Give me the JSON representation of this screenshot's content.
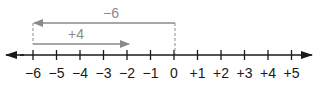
{
  "diagram": {
    "colors": {
      "axis": "#1a1a1a",
      "arrow": "#8a8a8a",
      "label": "#1a1a1a",
      "arrow_label": "#8a8a8a"
    },
    "number_line": {
      "min": -6,
      "max": 5,
      "ticks": [
        {
          "value": -6,
          "label": "−6"
        },
        {
          "value": -5,
          "label": "−5"
        },
        {
          "value": -4,
          "label": "−4"
        },
        {
          "value": -3,
          "label": "−3"
        },
        {
          "value": -2,
          "label": "−2"
        },
        {
          "value": -1,
          "label": "−1"
        },
        {
          "value": 0,
          "label": "0"
        },
        {
          "value": 1,
          "label": "+1"
        },
        {
          "value": 2,
          "label": "+2"
        },
        {
          "value": 3,
          "label": "+3"
        },
        {
          "value": 4,
          "label": "+4"
        },
        {
          "value": 5,
          "label": "+5"
        }
      ]
    },
    "arrows": [
      {
        "label": "−6",
        "from": 0,
        "to": -6,
        "row": "top"
      },
      {
        "label": "+4",
        "from": -6,
        "to": -2,
        "row": "bottom"
      }
    ]
  }
}
